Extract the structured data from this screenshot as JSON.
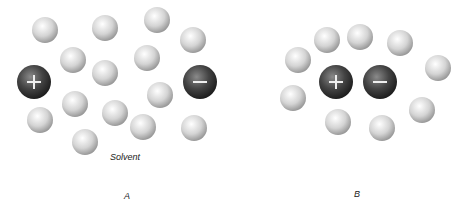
{
  "panels": [
    {
      "id": "A",
      "label": "A",
      "caption": "Solvent",
      "ions": [
        {
          "sign": "+",
          "x": 34,
          "y": 82,
          "r": 17
        },
        {
          "sign": "-",
          "x": 200,
          "y": 82,
          "r": 17
        }
      ],
      "solvent": [
        [
          45,
          30
        ],
        [
          105,
          28
        ],
        [
          157,
          20
        ],
        [
          193,
          40
        ],
        [
          73,
          60
        ],
        [
          147,
          58
        ],
        [
          105,
          73
        ],
        [
          75,
          104
        ],
        [
          160,
          95
        ],
        [
          115,
          113
        ],
        [
          40,
          120
        ],
        [
          143,
          127
        ],
        [
          194,
          128
        ],
        [
          85,
          142
        ]
      ]
    },
    {
      "id": "B",
      "label": "B",
      "ions": [
        {
          "sign": "+",
          "x": 336,
          "y": 82,
          "r": 17
        },
        {
          "sign": "-",
          "x": 380,
          "y": 82,
          "r": 17
        }
      ],
      "solvent": [
        [
          327,
          40
        ],
        [
          360,
          37
        ],
        [
          400,
          43
        ],
        [
          298,
          60
        ],
        [
          438,
          68
        ],
        [
          293,
          98
        ],
        [
          422,
          110
        ],
        [
          338,
          122
        ],
        [
          382,
          128
        ]
      ]
    }
  ],
  "colors": {
    "ion": "#3a3a3a",
    "solvent": "#d8d8d8",
    "text": "#222222"
  }
}
